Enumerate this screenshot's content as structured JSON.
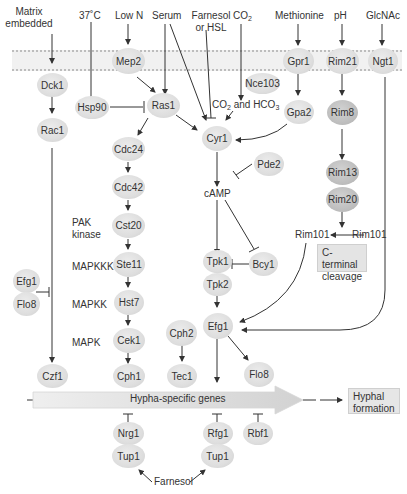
{
  "diagram": {
    "inputs": [
      {
        "id": "matrix",
        "label_line1": "Matrix",
        "label_line2": "embedded"
      },
      {
        "id": "temp",
        "label": "37˚C"
      },
      {
        "id": "lown",
        "label": "Low N"
      },
      {
        "id": "serum",
        "label": "Serum"
      },
      {
        "id": "farnesol_hsl",
        "label_line1": "Farnesol",
        "label_line2": "or HSL"
      },
      {
        "id": "co2",
        "label": "CO",
        "sub": "2"
      },
      {
        "id": "methionine",
        "label": "Methionine"
      },
      {
        "id": "ph",
        "label": "pH"
      },
      {
        "id": "glcnac",
        "label": "GlcNAc"
      }
    ],
    "nodes": {
      "mep2": "Mep2",
      "gpr1": "Gpr1",
      "rim21": "Rim21",
      "ngt1": "Ngt1",
      "dck1": "Dck1",
      "rac1": "Rac1",
      "hsp90": "Hsp90",
      "ras1": "Ras1",
      "nce103": "Nce103",
      "gpa2": "Gpa2",
      "rim8": "Rim8",
      "cyr1": "Cyr1",
      "cdc24": "Cdc24",
      "cdc42": "Cdc42",
      "cst20": "Cst20",
      "ste11": "Ste11",
      "hst7": "Hst7",
      "cek1": "Cek1",
      "cph1": "Cph1",
      "pde2": "Pde2",
      "rim13": "Rim13",
      "rim20": "Rim20",
      "tpk1": "Tpk1",
      "tpk2": "Tpk2",
      "bcy1": "Bcy1",
      "efg1_left": "Efg1",
      "flo8_left": "Flo8",
      "efg1": "Efg1",
      "cph2": "Cph2",
      "tec1": "Tec1",
      "flo8": "Flo8",
      "czf1": "Czf1",
      "nrg1": "Nrg1",
      "tup1_a": "Tup1",
      "rfg1": "Rfg1",
      "tup1_b": "Tup1",
      "rbf1": "Rbf1"
    },
    "text_labels": {
      "co2_hco3_a": "CO",
      "co2_hco3_sub1": "2",
      "co2_hco3_and": " and HCO",
      "co2_hco3_sub2": "3",
      "camp": "cAMP",
      "pak_line1": "PAK",
      "pak_line2": "kinase",
      "mapkkk": "MAPKKK",
      "mapkk": "MAPKK",
      "mapk": "MAPK",
      "rim101_active": "Rim101",
      "rim101_precursor": "Rim101",
      "cterm_line1": "C-terminal",
      "cterm_line2": "cleavage",
      "hypha_genes": "Hypha-specific genes",
      "hyphal_line1": "Hyphal",
      "hyphal_line2": "formation",
      "farnesol_bottom": "Farnesol"
    },
    "colors": {
      "node_light": "#dedede",
      "node_dark": "#bdbdbd",
      "membrane": "#f1f1f1",
      "edge": "#333333",
      "box": "#e4e4e4"
    }
  }
}
